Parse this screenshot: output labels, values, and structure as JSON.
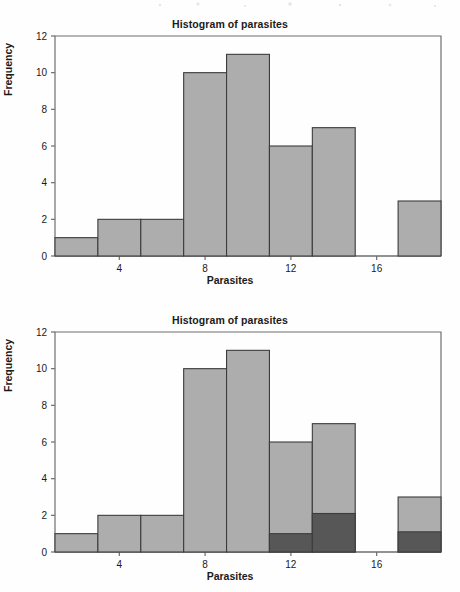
{
  "page": {
    "background": "#fefefe",
    "width": 460,
    "height": 592
  },
  "colors": {
    "bar_fill": "#adadad",
    "bar_fill_dark": "#575757",
    "bar_stroke": "#3c3c3c",
    "axis": "#6e6e6e",
    "text": "#1a1a1a"
  },
  "charts": [
    {
      "id": "top",
      "title": "Histogram of parasites",
      "xlabel": "Parasites",
      "ylabel": "Frequency"
    },
    {
      "id": "bottom",
      "title": "Histogram of parasites",
      "xlabel": "Parasites",
      "ylabel": "Frequency"
    }
  ],
  "chart_data": [
    {
      "type": "bar",
      "id": "histogram-top",
      "title": "Histogram of parasites",
      "xlabel": "Parasites",
      "ylabel": "Frequency",
      "xlim": [
        1,
        19
      ],
      "ylim": [
        0,
        12
      ],
      "xticks": [
        4,
        8,
        12,
        16
      ],
      "yticks": [
        0,
        2,
        4,
        6,
        8,
        10,
        12
      ],
      "grid": false,
      "legend": false,
      "bin_width": 2,
      "bin_edges": [
        1,
        3,
        5,
        7,
        9,
        11,
        13,
        15,
        17,
        19
      ],
      "categories": [
        "1-3",
        "3-5",
        "5-7",
        "7-9",
        "9-11",
        "11-13",
        "13-15",
        "15-17",
        "17-19"
      ],
      "values": [
        1,
        2,
        2,
        10,
        11,
        6,
        7,
        0,
        3
      ]
    },
    {
      "type": "bar",
      "id": "histogram-bottom",
      "title": "Histogram of parasites",
      "xlabel": "Parasites",
      "ylabel": "Frequency",
      "xlim": [
        1,
        19
      ],
      "ylim": [
        0,
        12
      ],
      "xticks": [
        4,
        8,
        12,
        16
      ],
      "yticks": [
        0,
        2,
        4,
        6,
        8,
        10,
        12
      ],
      "grid": false,
      "legend": false,
      "bin_width": 2,
      "bin_edges": [
        1,
        3,
        5,
        7,
        9,
        11,
        13,
        15,
        17,
        19
      ],
      "categories": [
        "1-3",
        "3-5",
        "5-7",
        "7-9",
        "9-11",
        "11-13",
        "13-15",
        "15-17",
        "17-19"
      ],
      "series": [
        {
          "name": "total",
          "values": [
            1,
            2,
            2,
            10,
            11,
            6,
            7,
            0,
            3
          ]
        },
        {
          "name": "highlighted",
          "values": [
            0,
            0,
            0,
            0,
            0,
            1,
            2.1,
            0,
            1.1
          ]
        }
      ]
    }
  ]
}
